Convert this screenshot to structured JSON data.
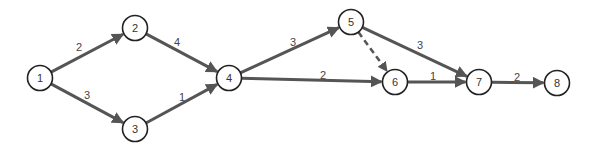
{
  "diagram": {
    "type": "activity-network",
    "colors": {
      "edge": "#555555",
      "node_stroke": "#222222",
      "text": "#333333",
      "background": "#ffffff"
    },
    "nodes": [
      {
        "id": "1",
        "label": "1",
        "x": 40,
        "y": 78
      },
      {
        "id": "2",
        "label": "2",
        "x": 135,
        "y": 28
      },
      {
        "id": "3",
        "label": "3",
        "x": 135,
        "y": 129
      },
      {
        "id": "4",
        "label": "4",
        "x": 229,
        "y": 78
      },
      {
        "id": "5",
        "label": "5",
        "x": 351,
        "y": 22
      },
      {
        "id": "6",
        "label": "6",
        "x": 395,
        "y": 82
      },
      {
        "id": "7",
        "label": "7",
        "x": 479,
        "y": 82
      },
      {
        "id": "8",
        "label": "8",
        "x": 557,
        "y": 83
      }
    ],
    "edges": [
      {
        "from": "1",
        "to": "2",
        "weight": "2",
        "dashed": false,
        "lx": 79,
        "ly": 47
      },
      {
        "from": "1",
        "to": "3",
        "weight": "3",
        "dashed": false,
        "lx": 87,
        "ly": 95
      },
      {
        "from": "2",
        "to": "4",
        "weight": "4",
        "dashed": false,
        "lx": 177,
        "ly": 42
      },
      {
        "from": "3",
        "to": "4",
        "weight": "1",
        "dashed": false,
        "lx": 182,
        "ly": 97
      },
      {
        "from": "4",
        "to": "5",
        "weight": "3",
        "dashed": false,
        "lx": 293,
        "ly": 42
      },
      {
        "from": "4",
        "to": "6",
        "weight": "2",
        "dashed": false,
        "lx": 323,
        "ly": 75
      },
      {
        "from": "5",
        "to": "6",
        "weight": "",
        "dashed": true,
        "lx": 0,
        "ly": 0
      },
      {
        "from": "5",
        "to": "7",
        "weight": "3",
        "dashed": false,
        "lx": 420,
        "ly": 45
      },
      {
        "from": "6",
        "to": "7",
        "weight": "1",
        "dashed": false,
        "lx": 433,
        "ly": 76
      },
      {
        "from": "7",
        "to": "8",
        "weight": "2",
        "dashed": false,
        "lx": 517,
        "ly": 77
      }
    ]
  }
}
